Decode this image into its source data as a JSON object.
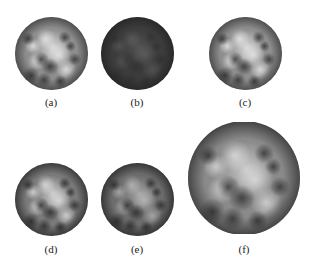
{
  "figure": {
    "panels": [
      {
        "id": "a",
        "label": "(a)",
        "tone": "normal"
      },
      {
        "id": "b",
        "label": "(b)",
        "tone": "dark"
      },
      {
        "id": "c",
        "label": "(c)",
        "tone": "normal"
      },
      {
        "id": "d",
        "label": "(d)",
        "tone": "medium"
      },
      {
        "id": "e",
        "label": "(e)",
        "tone": "medium-dark"
      },
      {
        "id": "f",
        "label": "(f)",
        "tone": "normal-large"
      }
    ]
  },
  "colors": {
    "background": "#ffffff",
    "disk_base_normal": "#8c8c8c",
    "disk_base_dark": "#3c3c3c",
    "disk_highlight": "#e6e6e6",
    "disk_shadow": "#2a2a2a",
    "label_text": "#222222"
  }
}
